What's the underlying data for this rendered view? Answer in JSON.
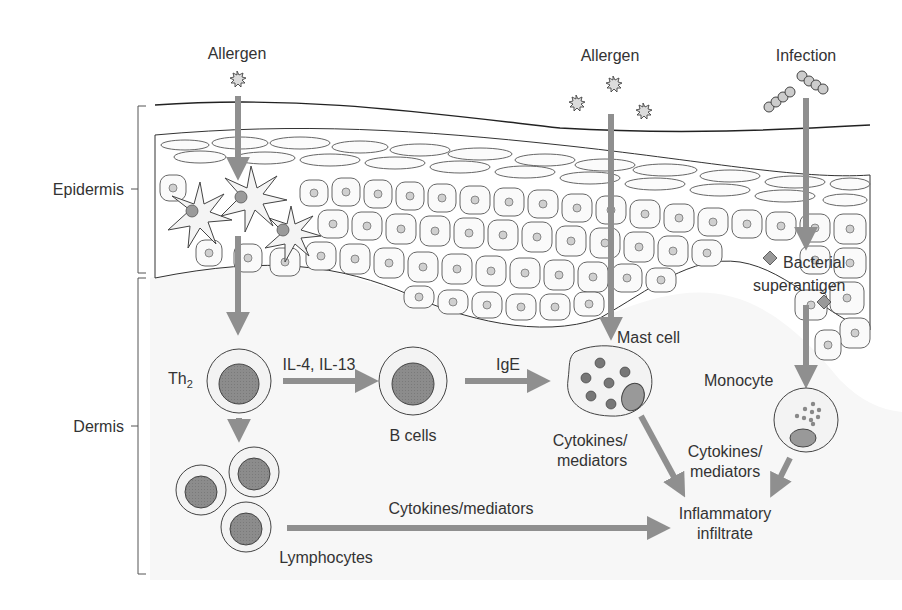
{
  "diagram": {
    "colors": {
      "arrow": "#8f8f8f",
      "outline": "#4a4a4a",
      "cell_fill": "#f2f2f2",
      "nucleus": "#8a8a8a",
      "dermis_bg": "#f7f7f7",
      "text": "#333333"
    },
    "layers": {
      "epidermis": "Epidermis",
      "dermis": "Dermis"
    },
    "triggers": {
      "allergen_left": "Allergen",
      "allergen_right": "Allergen",
      "infection": "Infection"
    },
    "nodes": {
      "th2_main": "Th",
      "th2_sub": "2",
      "b_cells": "B cells",
      "mast_cell": "Mast cell",
      "monocyte": "Monocyte",
      "lymphocytes": "Lymphocytes",
      "bacterial_superantigen_line1": "Bacterial",
      "bacterial_superantigen_line2": "superantigen",
      "inflammatory_line1": "Inflammatory",
      "inflammatory_line2": "infiltrate"
    },
    "edges": {
      "th2_to_bcells": "IL-4, IL-13",
      "bcells_to_mast": "IgE",
      "mast_to_infiltrate_line1": "Cytokines/",
      "mast_to_infiltrate_line2": "mediators",
      "monocyte_to_infiltrate_line1": "Cytokines/",
      "monocyte_to_infiltrate_line2": "mediators",
      "lymph_to_infiltrate": "Cytokines/mediators"
    }
  }
}
